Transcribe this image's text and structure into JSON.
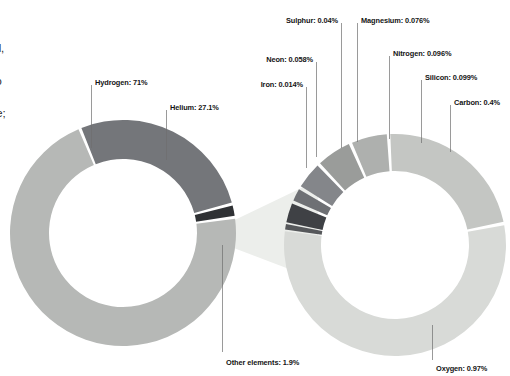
{
  "body_copy": {
    "lines": [
      "s.",
      "ures fall,",
      "r",
      "nbine to",
      "carbon",
      "nethane;",
      "gen",
      "s"
    ]
  },
  "palette": {
    "background": "#ffffff",
    "light_gray": "#b6b8b6",
    "dark_gray": "#74767a",
    "near_black": "#2f3134",
    "pale_gray": "#d8dad7",
    "pale_gray_2": "#cfd1ce",
    "mid_gray": "#9c9e9c",
    "label_text": "#141414",
    "leader_line": "#6f6f6f",
    "connector": "#eceeeb"
  },
  "chart_data": [
    {
      "type": "pie",
      "title": "Jupiter atmosphere composition",
      "variant": "donut",
      "start_angle": -8,
      "labels": [
        "Hydrogen",
        "Helium",
        "Other elements"
      ],
      "values": [
        71,
        27.1,
        1.9
      ],
      "value_unit": "%",
      "colors": [
        "#b6b8b6",
        "#74767a",
        "#2f3134"
      ],
      "data_labels": [
        "Hydrogen: 71%",
        "Helium: 27.1%",
        "Other elements: 1.9%"
      ]
    },
    {
      "type": "pie",
      "title": "Other elements breakdown",
      "variant": "donut",
      "start_angle": 188,
      "labels": [
        "Iron",
        "Neon",
        "Sulphur",
        "Magnesium",
        "Nitrogen",
        "Silicon",
        "Carbon",
        "Oxygen"
      ],
      "values": [
        0.014,
        0.058,
        0.04,
        0.076,
        0.096,
        0.099,
        0.4,
        0.97
      ],
      "value_unit": "%",
      "colors": [
        "#56585b",
        "#3f4145",
        "#6e7074",
        "#84868a",
        "#9a9c9a",
        "#aeb0ae",
        "#c4c6c3",
        "#d8dad7"
      ],
      "data_labels": [
        "Iron: 0.014%",
        "Neon: 0.058%",
        "Sulphur: 0.04%",
        "Magnesium: 0.076%",
        "Nitrogen: 0.096%",
        "Silicon: 0.099%",
        "Carbon: 0.4%",
        "Oxygen: 0.97%"
      ]
    }
  ],
  "callouts": {
    "hydrogen": "Hydrogen: 71%",
    "helium": "Helium: 27.1%",
    "other_elements": "Other elements: 1.9%",
    "iron": "Iron: 0.014%",
    "neon": "Neon: 0.058%",
    "sulphur": "Sulphur: 0.04%",
    "magnesium": "Magnesium: 0.076%",
    "nitrogen": "Nitrogen: 0.096%",
    "silicon": "Silicon: 0.099%",
    "carbon": "Carbon: 0.4%",
    "oxygen": "Oxygen: 0.97%"
  }
}
